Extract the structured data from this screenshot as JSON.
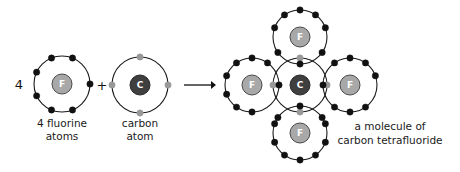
{
  "diagram": {
    "type": "chemistry-bonding-diagram",
    "background_color": "#ffffff"
  },
  "colors": {
    "shell_stroke": "#1a1a1a",
    "fluorine_electron": "#111111",
    "carbon_electron": "#999999",
    "fluorine_nucleus_fill": "#a8a8a8",
    "fluorine_nucleus_stroke": "#4a4a4a",
    "carbon_nucleus_fill": "#3f3f3f",
    "carbon_nucleus_stroke": "#2a2a2a",
    "nucleus_label": "#ffffff",
    "text": "#1a1a1a",
    "arrow": "#111111"
  },
  "equation": {
    "coefficient": "4",
    "plus_sign": "+",
    "arrow_symbol": "→"
  },
  "reactants": {
    "fluorine": {
      "nucleus_label": "F",
      "caption_line1": "4 fluorine",
      "caption_line2": "atoms",
      "valence_electrons": 7,
      "electron_color_key": "fluorine_electron",
      "center": {
        "x": 62,
        "y": 84
      },
      "shell_radius": 28,
      "nucleus_radius": 10,
      "electron_radius": 3.2,
      "electron_angles_deg": [
        0,
        68,
        112,
        155,
        205,
        248,
        292
      ]
    },
    "carbon": {
      "nucleus_label": "C",
      "caption_line1": "carbon",
      "caption_line2": "atom",
      "valence_electrons": 4,
      "electron_color_key": "carbon_electron",
      "center": {
        "x": 140,
        "y": 85
      },
      "shell_radius": 28,
      "nucleus_radius": 10,
      "electron_radius": 3.2,
      "electron_angles_deg": [
        0,
        90,
        180,
        270
      ]
    }
  },
  "arrow": {
    "x1": 184,
    "x2": 216,
    "y": 85,
    "head_size": 5
  },
  "product": {
    "caption_line1": "a molecule of",
    "caption_line2": "carbon tetrafluoride",
    "caption_x": 390,
    "caption_y1": 130,
    "caption_y2": 144,
    "formula": "CF4",
    "central_atom": {
      "nucleus_label": "C",
      "center": {
        "x": 300,
        "y": 85
      },
      "shell_radius": 27,
      "nucleus_radius": 10,
      "shared_electron_angles_deg": [
        0,
        90,
        180,
        270
      ]
    },
    "shell_radius": 27,
    "nucleus_radius": 10,
    "electron_radius": 3.2,
    "bond_count": 4,
    "fluorines": [
      {
        "nucleus_label": "F",
        "position_name": "top",
        "center": {
          "x": 300,
          "y": 37
        },
        "bond_angle_deg": 270,
        "lone_electron_angles_deg": [
          20,
          55,
          90,
          125,
          160,
          215,
          325
        ]
      },
      {
        "nucleus_label": "F",
        "position_name": "left",
        "center": {
          "x": 252,
          "y": 85
        },
        "bond_angle_deg": 0,
        "lone_electron_angles_deg": [
          55,
          90,
          125,
          160,
          200,
          235,
          270
        ]
      },
      {
        "nucleus_label": "F",
        "position_name": "right",
        "center": {
          "x": 350,
          "y": 85
        },
        "bond_angle_deg": 180,
        "lone_electron_angles_deg": [
          20,
          55,
          90,
          125,
          235,
          270,
          305
        ]
      },
      {
        "nucleus_label": "F",
        "position_name": "bottom",
        "center": {
          "x": 300,
          "y": 133
        },
        "bond_angle_deg": 90,
        "lone_electron_angles_deg": [
          20,
          35,
          145,
          160,
          200,
          235,
          270,
          305,
          340
        ]
      }
    ]
  }
}
